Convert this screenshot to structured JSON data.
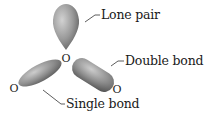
{
  "diagram": {
    "molecule": "ozone",
    "atoms": [
      {
        "id": "central",
        "symbol": "O",
        "x": 66,
        "y": 58
      },
      {
        "id": "left",
        "symbol": "O",
        "x": 14,
        "y": 88
      },
      {
        "id": "right",
        "symbol": "O",
        "x": 117,
        "y": 88
      }
    ],
    "labels": {
      "lone_pair": "Lone pair",
      "double_bond": "Double bond",
      "single_bond": "Single bond"
    },
    "colors": {
      "lobe_light": "#c4c4c4",
      "lobe_mid": "#8f8f8f",
      "lobe_dark": "#5a5a5a",
      "text": "#1a1a1a",
      "leader": "#333333"
    }
  }
}
